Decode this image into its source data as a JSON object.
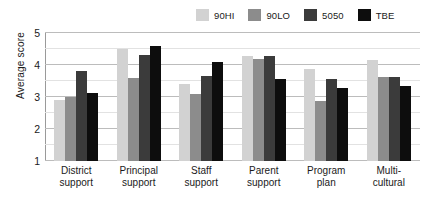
{
  "chart_data": {
    "type": "bar",
    "title": "",
    "xlabel": "",
    "ylabel": "Average score",
    "ylim": [
      1,
      5
    ],
    "yticks": [
      1,
      2,
      3,
      4,
      5
    ],
    "minor_gridlines": [
      1.5,
      2.5,
      3.5,
      4.5
    ],
    "grid": true,
    "legend_position": "top-right",
    "categories": [
      "District support",
      "Principal support",
      "Staff support",
      "Parent support",
      "Program plan",
      "Multi-cultural"
    ],
    "category_lines": [
      [
        "District",
        "support"
      ],
      [
        "Principal",
        "support"
      ],
      [
        "Staff",
        "support"
      ],
      [
        "Parent",
        "support"
      ],
      [
        "Program",
        "plan"
      ],
      [
        "Multi-",
        "cultural"
      ]
    ],
    "series": [
      {
        "name": "90HI",
        "color": "#d2d2d2",
        "values": [
          2.92,
          4.5,
          3.4,
          4.27,
          3.87,
          4.17
        ]
      },
      {
        "name": "90LO",
        "color": "#8c8c8c",
        "values": [
          3.0,
          3.6,
          3.1,
          4.18,
          2.87,
          3.63
        ]
      },
      {
        "name": "5050",
        "color": "#3b3b3b",
        "values": [
          3.8,
          4.3,
          3.65,
          4.27,
          3.55,
          3.63
        ]
      },
      {
        "name": "TBE",
        "color": "#0d0d0d",
        "values": [
          3.12,
          4.58,
          4.08,
          3.55,
          3.28,
          3.35
        ]
      }
    ]
  },
  "axis": {
    "y_title": "Average score",
    "tick_labels": [
      "5",
      "4",
      "3",
      "2",
      "1"
    ]
  },
  "legend": {
    "entries": [
      {
        "label": "90HI",
        "color": "#d2d2d2"
      },
      {
        "label": "90LO",
        "color": "#8c8c8c"
      },
      {
        "label": "5050",
        "color": "#3b3b3b"
      },
      {
        "label": "TBE",
        "color": "#0d0d0d"
      }
    ]
  },
  "colors": {
    "background": "#ffffff",
    "axis": "#9a9a9a",
    "gridline_major": "#bcbcbc",
    "gridline_minor": "#e2e2e2",
    "text": "#1a1a1a"
  }
}
